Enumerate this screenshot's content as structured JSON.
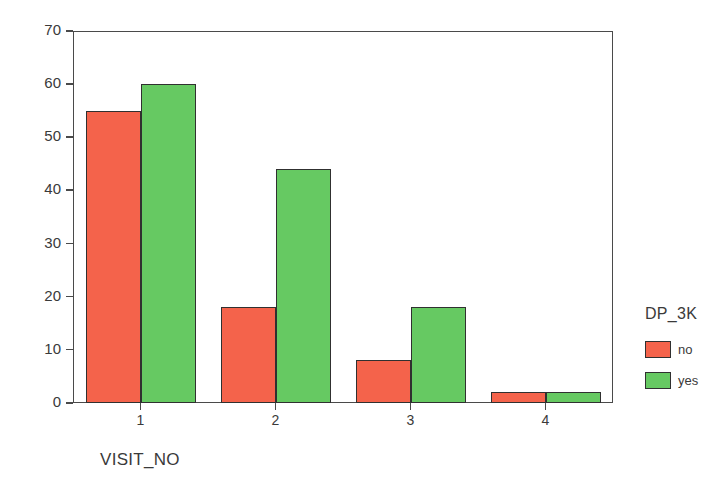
{
  "chart_data": {
    "type": "bar",
    "title": "",
    "xlabel": "VISIT_NO",
    "ylabel": "Count",
    "categories": [
      "1",
      "2",
      "3",
      "4"
    ],
    "series": [
      {
        "name": "no",
        "color": "#F4634B",
        "values": [
          55,
          18,
          8,
          2
        ]
      },
      {
        "name": "yes",
        "color": "#66C962",
        "values": [
          60,
          44,
          18,
          2
        ]
      }
    ],
    "legend": {
      "title": "DP_3K",
      "position": "right",
      "entries": [
        {
          "label": "no",
          "color": "#F4634B"
        },
        {
          "label": "yes",
          "color": "#66C962"
        }
      ]
    },
    "ylim": [
      0,
      70
    ],
    "yticks": [
      0,
      10,
      20,
      30,
      40,
      50,
      60,
      70
    ],
    "ytick_labels": [
      "0",
      "10",
      "20",
      "30",
      "40",
      "50",
      "60",
      "70"
    ],
    "xtick_labels": [
      "1",
      "2",
      "3",
      "4"
    ],
    "grid": false,
    "frame_color": "#4A4A4A",
    "bar_edge_color": "#303030",
    "background": "#FFFFFF"
  }
}
